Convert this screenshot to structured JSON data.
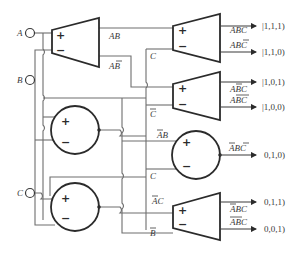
{
  "diagram": {
    "title": "",
    "inputs": [
      {
        "id": "A",
        "label": "A"
      },
      {
        "id": "B",
        "label": "B"
      },
      {
        "id": "C",
        "label": "C"
      }
    ],
    "comparators": [
      {
        "id": "trap-ab",
        "shape": "trapezoid",
        "plus": "+",
        "minus": "−",
        "inputs": [
          "A",
          "B"
        ],
        "outputs": [
          "AB",
          "AB̄"
        ]
      },
      {
        "id": "trap-abc-1",
        "shape": "trapezoid",
        "plus": "+",
        "minus": "−",
        "inputs": [
          "AB",
          "C"
        ],
        "outputs": [
          "ABC",
          "ABC̄"
        ]
      },
      {
        "id": "trap-abc-2",
        "shape": "trapezoid",
        "plus": "+",
        "minus": "−",
        "inputs": [
          "AB̄",
          "C"
        ],
        "outputs": [
          "AB̄C",
          "AB̄C̄"
        ]
      },
      {
        "id": "circle-b",
        "shape": "circle",
        "plus": "+",
        "minus": "−"
      },
      {
        "id": "circle-c",
        "shape": "circle",
        "plus": "+",
        "minus": "−"
      },
      {
        "id": "circle-abc",
        "shape": "circle",
        "plus": "+",
        "minus": "−",
        "inputs": [
          "ĀB",
          "C"
        ],
        "outputs": [
          "ĀBC̄"
        ]
      },
      {
        "id": "trap-abc-4",
        "shape": "trapezoid",
        "plus": "+",
        "minus": "−",
        "inputs": [
          "ĀC",
          "B"
        ],
        "outputs": [
          "ĀB̄C",
          "ĀB̄C̄"
        ]
      }
    ],
    "wire_labels": {
      "ab": "AB",
      "ab_bar": "AB",
      "c1": "C",
      "c2": "C",
      "abar_b": "AB",
      "c3": "C",
      "abar_c": "AC",
      "b4": "B"
    },
    "outputs": [
      {
        "label": "ABC",
        "state": "|1,1,1⟩",
        "state_text": "|1,1,1)"
      },
      {
        "label": "ABC",
        "state": "|1,1,0)",
        "state_text": "|1,1,0)"
      },
      {
        "label": "ABC",
        "state": "|1,0,1)",
        "state_text": "|1,0,1)"
      },
      {
        "label": "ABC",
        "state": "|1,0,0)",
        "state_text": "|1,0,0)"
      },
      {
        "label": "ABC",
        "state": "|0,1,0)",
        "state_text": "0,1,0)"
      },
      {
        "label": "ABC",
        "state": "|0,1,1)",
        "state_text": "0,1,1)"
      },
      {
        "label": "ABC",
        "state": "|0,0,1)",
        "state_text": "0,0,1)"
      }
    ],
    "plus": "+",
    "minus": "−"
  }
}
